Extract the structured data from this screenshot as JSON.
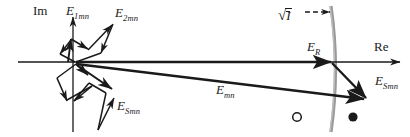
{
  "figure": {
    "kind": "phasor-vector-diagram",
    "width": 410,
    "height": 137,
    "background_color": "#ffffff",
    "ink_color": "#1a1a1a",
    "curve_color": "#999999"
  },
  "axes": {
    "imaginary": {
      "label": "Im",
      "label_x": 33,
      "label_y": 11,
      "x": 73,
      "y_top": 16,
      "y_bottom": 132,
      "arrow": "up"
    },
    "real": {
      "label": "Re",
      "label_x": 374,
      "label_y": 47,
      "y": 62,
      "x_left": 18,
      "x_right": 402,
      "arrow": "right"
    }
  },
  "vectors": [
    {
      "id": "E1mn",
      "label": "E",
      "sub": "1mn",
      "label_x": 66,
      "label_y": 9,
      "description": "first partial phasor of the zig-zag chain, upper cluster"
    },
    {
      "id": "E2mn",
      "label": "E",
      "sub": "2mn",
      "label_x": 115,
      "label_y": 11,
      "description": "second partial phasor, upper cluster"
    },
    {
      "id": "ESmn_upper",
      "label": "E",
      "sub": "Smn",
      "label_x": 117,
      "label_y": 105,
      "description": "S-th partial phasor, lower cluster"
    },
    {
      "id": "Emn",
      "label": "E",
      "sub": "mn",
      "label_x": 216,
      "label_y": 89,
      "description": "resultant long phasor from origin to lower-right endpoint"
    },
    {
      "id": "ER",
      "label": "E",
      "sub": "R",
      "label_x": 307,
      "label_y": 46,
      "description": "real-axis phasor terminating on the gray curve"
    },
    {
      "id": "ESmn_right",
      "label": "E",
      "sub": "Smn",
      "label_x": 375,
      "label_y": 80,
      "description": "phasor from curve intersection down-right to Emn tip"
    }
  ],
  "annotations": {
    "sqrt_i": {
      "radical": "√",
      "body": "I",
      "overbar": true,
      "label_x": 281,
      "label_y": 16,
      "arrow_from_x": 305,
      "arrow_from_y": 12,
      "arrow_to_x": 334,
      "arrow_to_y": 12,
      "description": "square root of mean intensity, arrow points to the gray curve"
    }
  },
  "markers": [
    {
      "id": "open-circle-marker",
      "style": "open",
      "cx": 297,
      "cy": 117,
      "r": 4.5
    },
    {
      "id": "filled-circle-marker",
      "style": "filled",
      "cx": 353,
      "cy": 117,
      "r": 4.5
    }
  ],
  "curve": {
    "id": "gray-arc",
    "color": "#999999",
    "description": "slightly bowed near-vertical gray curve crossing the real axis",
    "top_x": 331,
    "top_y": 6,
    "mid_x": 337,
    "mid_y": 68,
    "bottom_x": 331,
    "bottom_y": 132
  }
}
